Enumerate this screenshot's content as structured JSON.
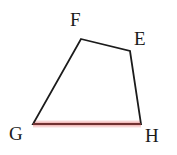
{
  "figure": {
    "name": "quadrilateral-efgh",
    "background_color": "#ffffff",
    "stroke_color": "#1b1b1b",
    "stroke_width": 1.8,
    "highlight_core_color": "#8f3b3b",
    "highlight_glow_color": "#f3bdbd",
    "highlight_glow_outer_color": "#f8dcdc"
  },
  "vertices": [
    {
      "id": "F",
      "label": "F",
      "x": 81,
      "y": 39
    },
    {
      "id": "E",
      "label": "E",
      "x": 130,
      "y": 51
    },
    {
      "id": "H",
      "label": "H",
      "x": 141,
      "y": 124
    },
    {
      "id": "G",
      "label": "G",
      "x": 33,
      "y": 124
    }
  ],
  "edges": [
    {
      "id": "FE",
      "from": "F",
      "to": "E",
      "highlighted": false
    },
    {
      "id": "EH",
      "from": "E",
      "to": "H",
      "highlighted": false
    },
    {
      "id": "HG",
      "from": "H",
      "to": "G",
      "highlighted": true
    },
    {
      "id": "GF",
      "from": "G",
      "to": "F",
      "highlighted": false
    }
  ],
  "labels": {
    "F": {
      "text": "F",
      "left": 70,
      "top": 10
    },
    "E": {
      "text": "E",
      "left": 134,
      "top": 29
    },
    "G": {
      "text": "G",
      "left": 9,
      "top": 124
    },
    "H": {
      "text": "H",
      "left": 145,
      "top": 126
    }
  },
  "path": {
    "outline": "M 81 39 L 130 51 L 141 124 L 33 124 Z",
    "highlight_segment": "M 33 124 L 141 124"
  }
}
